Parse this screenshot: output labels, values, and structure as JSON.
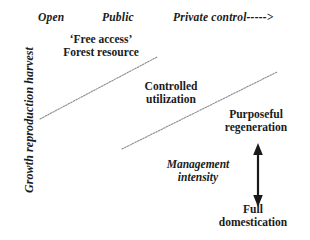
{
  "figure": {
    "axis": {
      "y_label": "Growth reproduction harvest"
    },
    "top_axis": {
      "tiers": [
        {
          "label": "Open"
        },
        {
          "label": "Public"
        },
        {
          "label": "Private control----->"
        }
      ]
    },
    "zones": [
      {
        "line1": "‘Free access’",
        "line2": "Forest resource"
      },
      {
        "line1": "Controlled",
        "line2": "utilization"
      },
      {
        "line1": "Purposeful",
        "line2": "regeneration"
      },
      {
        "line1": "Full",
        "line2": "domestication"
      }
    ],
    "management": {
      "line1": "Management",
      "line2": "intensity"
    },
    "colors": {
      "text": "#1a1a1a",
      "divider_line": "#8c8c8c",
      "arrow": "#1a1a1a",
      "background": "#ffffff"
    }
  }
}
